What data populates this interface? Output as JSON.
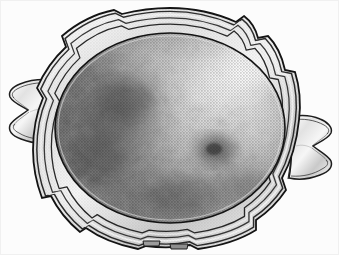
{
  "image": {
    "kind": "halftone-photograph",
    "subject": "antique silver two-handled scalloped tray",
    "orientation": "landscape",
    "width_px": 339,
    "height_px": 255,
    "color_mode": "grayscale",
    "caption_text": "",
    "alt_text": "Black and white halftone photograph of an oval antique silver tray with a shaped scalloped rim and two flared cast handles"
  },
  "palette": {
    "background": "#fcfcfc",
    "paper_white": "#f7f7f7",
    "rim_highlight": "#f2f2f2",
    "rim_midtone": "#b8b8b8",
    "rim_shadow": "#2e2e2e",
    "outline": "#1a1a1a",
    "well_light": "#dcdcdc",
    "well_mid": "#9a9a9a",
    "well_dark": "#5e5e5e",
    "well_darkest": "#3a3a3a",
    "tarnish_blotch": "#464646",
    "specular_highlight": "#f4f4f4"
  },
  "geometry": {
    "tray_center": {
      "x": 170,
      "y": 128
    },
    "well_radius_x": 118,
    "well_radius_y": 96,
    "rim_band_count": 4,
    "scallop_lobe_count": 8,
    "handle_left": {
      "x": 8,
      "y": 78,
      "w": 44,
      "h": 64
    },
    "handle_right": {
      "x": 290,
      "y": 114,
      "w": 45,
      "h": 68
    },
    "foot_positions": [
      {
        "x": 150,
        "y": 243
      },
      {
        "x": 178,
        "y": 246
      }
    ]
  },
  "tonal_features": {
    "highlight_region": {
      "label": "upper-right specular sheen",
      "cx": 236,
      "cy": 78
    },
    "dark_region": {
      "label": "left tarnish shadow",
      "cx": 110,
      "cy": 120
    },
    "blotch_region": {
      "label": "central tarnish blotch",
      "cx": 216,
      "cy": 150
    },
    "lower_shade": {
      "label": "lower well shading",
      "cx": 175,
      "cy": 196
    }
  },
  "parts": {
    "well": "tray-well",
    "rim": "tray-rim",
    "left_handle": "left-handle",
    "right_handle": "right-handle",
    "feet": "tray-feet"
  }
}
